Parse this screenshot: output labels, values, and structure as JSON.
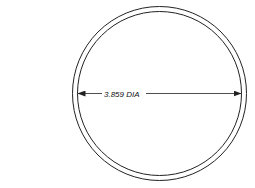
{
  "drawing": {
    "type": "ring-technical-drawing",
    "dimension_label": "3.859 DIA",
    "colors": {
      "line": "#222222",
      "background": "#ffffff"
    }
  }
}
